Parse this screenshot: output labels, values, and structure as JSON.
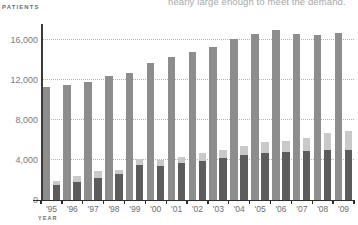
{
  "caption": {
    "clipped_text": "nearly large enough to meet the demand."
  },
  "axis_titles": {
    "y": "PATIENTS",
    "x": "YEAR"
  },
  "chart_data": {
    "type": "bar",
    "title": "",
    "subtitle": "",
    "xlabel": "YEAR",
    "ylabel": "PATIENTS",
    "ylim": [
      0,
      18000
    ],
    "ytick_labels": [
      "0",
      "4,000",
      "8,000",
      "12,000",
      "16,000"
    ],
    "ytick_values": [
      0,
      4000,
      8000,
      12000,
      16000
    ],
    "grid": true,
    "grid_axis": "y",
    "legend": "none",
    "legend_position": "none",
    "categories": [
      "'95",
      "'96",
      "'97",
      "'98",
      "'99",
      "'00",
      "'01",
      "'02",
      "'03",
      "'04",
      "'05",
      "'06",
      "'07",
      "'08",
      "'09"
    ],
    "series": [
      {
        "name": "Waiting list",
        "color": "#8d8d8d",
        "values": [
          11300,
          11500,
          11850,
          12450,
          12700,
          13700,
          14350,
          14800,
          15350,
          16100,
          16600,
          17000,
          16650,
          16550,
          16750
        ]
      },
      {
        "name": "Transplants",
        "color": "#5c5c5c",
        "values": [
          1500,
          1800,
          2200,
          2600,
          3500,
          3450,
          3750,
          3950,
          4200,
          4550,
          4700,
          4800,
          4900,
          5000,
          5000
        ]
      },
      {
        "name": "Donors added",
        "color": "#c9c9c9",
        "values": [
          400,
          600,
          750,
          450,
          650,
          600,
          600,
          750,
          800,
          850,
          1100,
          1150,
          1300,
          1700,
          1950
        ]
      }
    ]
  }
}
